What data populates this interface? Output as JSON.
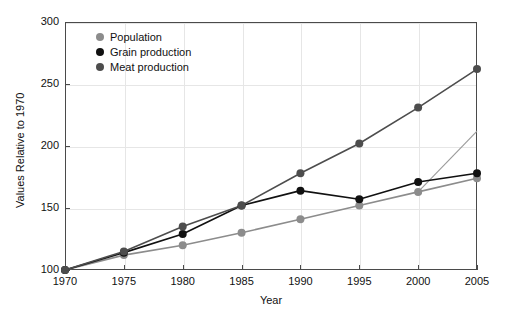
{
  "chart_data": {
    "type": "line",
    "title": "",
    "xlabel": "Year",
    "ylabel": "Values Relative to 1970",
    "x": [
      1970,
      1975,
      1980,
      1985,
      1990,
      1995,
      2000,
      2005
    ],
    "xticklabels": [
      "1970",
      "1975",
      "1980",
      "1985",
      "1990",
      "1995",
      "2000",
      "2005"
    ],
    "yticklabels": [
      "100",
      "150",
      "200",
      "250",
      "300"
    ],
    "yticks": [
      100,
      150,
      200,
      250,
      300
    ],
    "xlim": [
      1970,
      2005
    ],
    "ylim": [
      100,
      300
    ],
    "grid": true,
    "legend_position": "top-left-inside",
    "series": [
      {
        "name": "Population",
        "color": "#8c8c8c",
        "marker": "circle",
        "values": [
          100,
          112,
          120,
          130,
          141,
          152,
          163,
          174
        ]
      },
      {
        "name": "Grain production",
        "color": "#111111",
        "marker": "circle",
        "values": [
          100,
          114,
          129,
          152,
          164,
          157,
          171,
          178
        ]
      },
      {
        "name": "Meat production",
        "color": "#4d4d4d",
        "marker": "circle",
        "values": [
          100,
          115,
          135,
          152,
          178,
          202,
          231,
          262
        ]
      }
    ],
    "extra_lines": [
      {
        "name": "unlabeled-gray-trend",
        "color": "#9a9a9a",
        "x": [
          2000,
          2005
        ],
        "values": [
          163,
          212
        ]
      }
    ]
  },
  "legend": {
    "items": [
      {
        "label": "Population",
        "color": "#8c8c8c"
      },
      {
        "label": "Grain production",
        "color": "#111111"
      },
      {
        "label": "Meat production",
        "color": "#4d4d4d"
      }
    ]
  },
  "axes": {
    "y_title": "Values Relative to 1970",
    "x_title": "Year"
  }
}
